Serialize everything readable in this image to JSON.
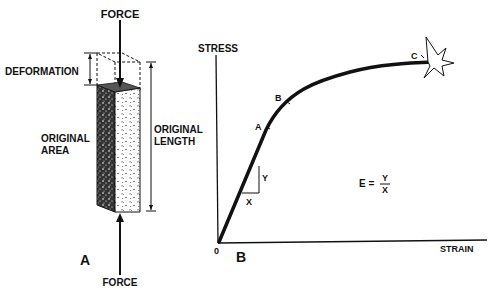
{
  "panel_a": {
    "label": "A",
    "force_top": "FORCE",
    "force_bottom": "FORCE",
    "deformation": "DEFORMATION",
    "original_area_line1": "ORIGINAL",
    "original_area_line2": "AREA",
    "original_length_line1": "ORIGINAL",
    "original_length_line2": "LENGTH"
  },
  "panel_b": {
    "label": "B",
    "y_axis": "STRESS",
    "x_axis": "STRAIN",
    "origin": "0",
    "point_a": "A",
    "point_b": "B",
    "point_c": "C",
    "slope_y": "Y",
    "slope_x": "X",
    "formula_lhs": "E =",
    "formula_num": "Y",
    "formula_den": "X"
  },
  "colors": {
    "ink": "#111111",
    "background": "#ffffff"
  }
}
